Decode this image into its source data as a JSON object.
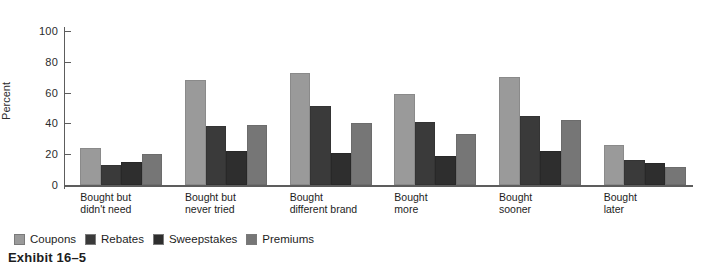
{
  "caption": "Exhibit 16–5",
  "chart_data": {
    "type": "bar",
    "title": "",
    "xlabel": "",
    "ylabel": "Percent",
    "ylim": [
      0,
      100
    ],
    "yticks": [
      0,
      20,
      40,
      60,
      80,
      100
    ],
    "ytick_labels": [
      "0",
      "20",
      "40",
      "60",
      "80",
      "100"
    ],
    "grid": false,
    "legend_position": "bottom-left",
    "categories": [
      "Bought but\ndidn't need",
      "Bought but\nnever tried",
      "Bought\ndifferent brand",
      "Bought\nmore",
      "Bought\nsooner",
      "Bought\nlater"
    ],
    "series": [
      {
        "name": "Coupons",
        "color": "#9a9a9a",
        "values": [
          24,
          68,
          73,
          59,
          70,
          26
        ]
      },
      {
        "name": "Rebates",
        "color": "#3a3a3a",
        "values": [
          13,
          38,
          51,
          41,
          45,
          16
        ]
      },
      {
        "name": "Sweepstakes",
        "color": "#2e2e2e",
        "values": [
          15,
          22,
          21,
          19,
          22,
          14
        ]
      },
      {
        "name": "Premiums",
        "color": "#767676",
        "values": [
          20,
          39,
          40,
          33,
          42,
          12
        ]
      }
    ]
  }
}
